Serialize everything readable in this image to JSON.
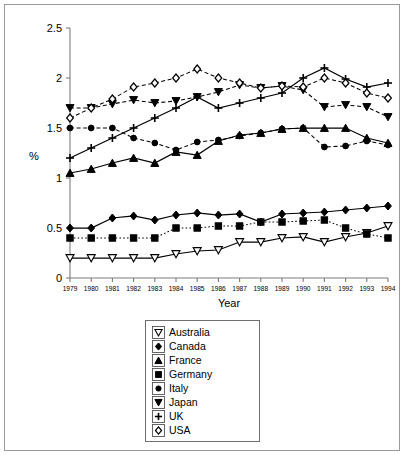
{
  "chart_data": {
    "type": "line",
    "title": "",
    "xlabel": "Year",
    "ylabel": "%",
    "x": [
      1979,
      1980,
      1981,
      1982,
      1983,
      1984,
      1985,
      1986,
      1987,
      1988,
      1989,
      1990,
      1991,
      1992,
      1993,
      1994
    ],
    "xlim": [
      1978.5,
      1994.5
    ],
    "ylim": [
      0,
      2.5
    ],
    "yticks": [
      0,
      0.5,
      1,
      1.5,
      2,
      2.5
    ],
    "yticklabels": [
      "0",
      "0.5",
      "1",
      "1.5",
      "2",
      "2.5"
    ],
    "xticklabels": [
      "1979",
      "1980",
      "1981",
      "1982",
      "1983",
      "1984",
      "1985",
      "1986",
      "1987",
      "1988",
      "1989",
      "1990",
      "1991",
      "1992",
      "1993",
      "1994"
    ],
    "grid": false,
    "legend_position": "below-plot",
    "series": [
      {
        "name": "Australia",
        "marker": "triangle-down-open",
        "linestyle": "solid",
        "color": "#000000",
        "values": [
          0.2,
          0.2,
          0.2,
          0.2,
          0.2,
          0.24,
          0.27,
          0.28,
          0.36,
          0.36,
          0.4,
          0.41,
          0.36,
          0.41,
          0.45,
          0.52
        ]
      },
      {
        "name": "Canada",
        "marker": "diamond-filled",
        "linestyle": "solid",
        "color": "#000000",
        "values": [
          0.5,
          0.5,
          0.6,
          0.62,
          0.58,
          0.63,
          0.65,
          0.63,
          0.64,
          0.56,
          0.64,
          0.65,
          0.66,
          0.68,
          0.7,
          0.72
        ]
      },
      {
        "name": "France",
        "marker": "triangle-up-filled",
        "linestyle": "solid",
        "color": "#000000",
        "values": [
          1.05,
          1.09,
          1.15,
          1.2,
          1.15,
          1.26,
          1.23,
          1.37,
          1.43,
          1.45,
          1.49,
          1.5,
          1.5,
          1.5,
          1.4,
          1.35
        ]
      },
      {
        "name": "Germany",
        "marker": "square-filled",
        "linestyle": "dotted",
        "color": "#000000",
        "values": [
          0.4,
          0.4,
          0.4,
          0.4,
          0.4,
          0.5,
          0.5,
          0.52,
          0.52,
          0.56,
          0.56,
          0.57,
          0.58,
          0.5,
          0.44,
          0.4
        ]
      },
      {
        "name": "Italy",
        "marker": "circle-filled",
        "linestyle": "dashed",
        "color": "#000000",
        "values": [
          1.5,
          1.5,
          1.5,
          1.4,
          1.35,
          1.28,
          1.36,
          1.38,
          1.42,
          1.45,
          1.49,
          1.5,
          1.31,
          1.32,
          1.37,
          1.33
        ]
      },
      {
        "name": "Japan",
        "marker": "triangle-down-filled",
        "linestyle": "dashed",
        "color": "#000000",
        "values": [
          1.7,
          1.7,
          1.74,
          1.78,
          1.75,
          1.77,
          1.81,
          1.86,
          1.93,
          1.9,
          1.92,
          1.88,
          1.71,
          1.73,
          1.71,
          1.61
        ]
      },
      {
        "name": "UK",
        "marker": "plus",
        "linestyle": "solid",
        "color": "#000000",
        "values": [
          1.2,
          1.3,
          1.4,
          1.5,
          1.6,
          1.7,
          1.81,
          1.7,
          1.75,
          1.8,
          1.85,
          2.0,
          2.1,
          1.99,
          1.91,
          1.95
        ]
      },
      {
        "name": "USA",
        "marker": "diamond-open",
        "linestyle": "dashed",
        "color": "#000000",
        "values": [
          1.6,
          1.7,
          1.79,
          1.91,
          1.95,
          2.0,
          2.09,
          2.0,
          1.95,
          1.9,
          1.92,
          1.91,
          2.0,
          1.95,
          1.85,
          1.8
        ]
      }
    ]
  },
  "legend": {
    "items": [
      {
        "label": "Australia",
        "marker": "triangle-down-open"
      },
      {
        "label": "Canada",
        "marker": "diamond-filled"
      },
      {
        "label": "France",
        "marker": "triangle-up-filled"
      },
      {
        "label": "Germany",
        "marker": "square-filled"
      },
      {
        "label": "Italy",
        "marker": "circle-filled"
      },
      {
        "label": "Japan",
        "marker": "triangle-down-filled"
      },
      {
        "label": "UK",
        "marker": "plus"
      },
      {
        "label": "USA",
        "marker": "diamond-open"
      }
    ]
  }
}
